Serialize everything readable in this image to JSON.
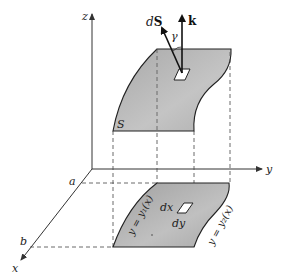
{
  "figure": {
    "axes": {
      "z_label": "z",
      "y_label": "y",
      "x_label": "x"
    },
    "bounds": {
      "a_label": "a",
      "b_label": "b"
    },
    "surface": {
      "label": "S",
      "fill": "#b8b8b8"
    },
    "vectors": {
      "normal_d": "d",
      "normal_S": "S",
      "k_label": "k",
      "angle_label": "γ"
    },
    "region": {
      "curve1": "y = y₁(x)",
      "curve2": "y = y₂(x)",
      "dx_label": "dx",
      "dy_label": "dy"
    }
  }
}
